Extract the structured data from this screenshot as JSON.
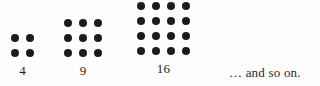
{
  "figure": {
    "background_color": "#fefefe",
    "dot_color": "#1c1c1c",
    "text_color": "#1c1c1c",
    "trailing_text": "… and so on.",
    "groups": [
      {
        "name": "square-number-4",
        "label": "4",
        "rows": 2,
        "cols": 2,
        "dot_count": 4
      },
      {
        "name": "square-number-9",
        "label": "9",
        "rows": 3,
        "cols": 3,
        "dot_count": 9
      },
      {
        "name": "square-number-16",
        "label": "16",
        "rows": 4,
        "cols": 4,
        "dot_count": 16
      }
    ]
  },
  "chart_data": {
    "type": "scatter",
    "title": "",
    "subtitle": "",
    "xlabel": "",
    "ylabel": "",
    "categories": [
      "4",
      "9",
      "16"
    ],
    "values": [
      4,
      9,
      16
    ],
    "series": [
      {
        "name": "square numbers",
        "values": [
          4,
          9,
          16
        ]
      },
      {
        "name": "grid side length",
        "values": [
          2,
          3,
          4
        ]
      }
    ],
    "annotations": [
      "4",
      "9",
      "16",
      "… and so on."
    ],
    "grid": false,
    "legend": "none"
  }
}
